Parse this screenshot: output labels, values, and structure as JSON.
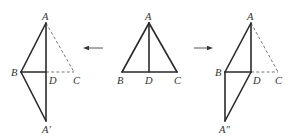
{
  "figures": [
    {
      "id": "left",
      "description": "Triangle ABC folded along AD... reflected: triangle ABA' with dashed original AC",
      "points": {
        "A": [
          46,
          23
        ],
        "B": [
          21,
          72
        ],
        "D": [
          46,
          72
        ],
        "C": [
          74,
          72
        ],
        "A_prime": [
          46,
          121
        ]
      },
      "labels": {
        "A": "A",
        "B": "B",
        "D": "D",
        "C": "C",
        "A_prime": "A′"
      },
      "solid_segments": [
        [
          "A",
          "B"
        ],
        [
          "A",
          "A_prime"
        ],
        [
          "B",
          "D"
        ],
        [
          "B",
          "A_prime"
        ]
      ],
      "dashed_segments": [
        [
          "A",
          "C"
        ],
        [
          "D",
          "C"
        ]
      ]
    },
    {
      "id": "middle",
      "description": "Isosceles triangle ABC with median/altitude AD",
      "points": {
        "A": [
          149,
          23
        ],
        "B": [
          122,
          72
        ],
        "D": [
          149,
          72
        ],
        "C": [
          177,
          72
        ]
      },
      "labels": {
        "A": "A",
        "B": "B",
        "D": "D",
        "C": "C"
      },
      "solid_segments": [
        [
          "A",
          "B"
        ],
        [
          "A",
          "C"
        ],
        [
          "B",
          "C"
        ],
        [
          "A",
          "D"
        ]
      ],
      "dashed_segments": []
    },
    {
      "id": "right",
      "description": "Triangle ADC translated to BA''D forming parallelogram ABA''D",
      "points": {
        "A": [
          251,
          23
        ],
        "B": [
          225,
          72
        ],
        "D": [
          251,
          72
        ],
        "C": [
          278,
          72
        ],
        "A_double_prime": [
          225,
          121
        ]
      },
      "labels": {
        "A": "A",
        "B": "B",
        "D": "D",
        "C": "C",
        "A_double_prime": "A″"
      },
      "solid_segments": [
        [
          "A",
          "B"
        ],
        [
          "A",
          "D"
        ],
        [
          "B",
          "D"
        ],
        [
          "B",
          "A_double_prime"
        ],
        [
          "D",
          "A_double_prime"
        ]
      ],
      "dashed_segments": [
        [
          "A",
          "C"
        ],
        [
          "D",
          "C"
        ]
      ]
    }
  ],
  "arrows": [
    {
      "id": "to-left",
      "direction": "left",
      "from": [
        103,
        48
      ],
      "to": [
        83,
        48
      ]
    },
    {
      "id": "to-right",
      "direction": "right",
      "from": [
        194,
        48
      ],
      "to": [
        213,
        48
      ]
    }
  ],
  "text": {
    "left": {
      "A": "A",
      "B": "B",
      "D": "D",
      "C": "C",
      "Ap": "A′"
    },
    "middle": {
      "A": "A",
      "B": "B",
      "D": "D",
      "C": "C"
    },
    "right": {
      "A": "A",
      "B": "B",
      "D": "D",
      "C": "C",
      "App": "A″"
    }
  }
}
